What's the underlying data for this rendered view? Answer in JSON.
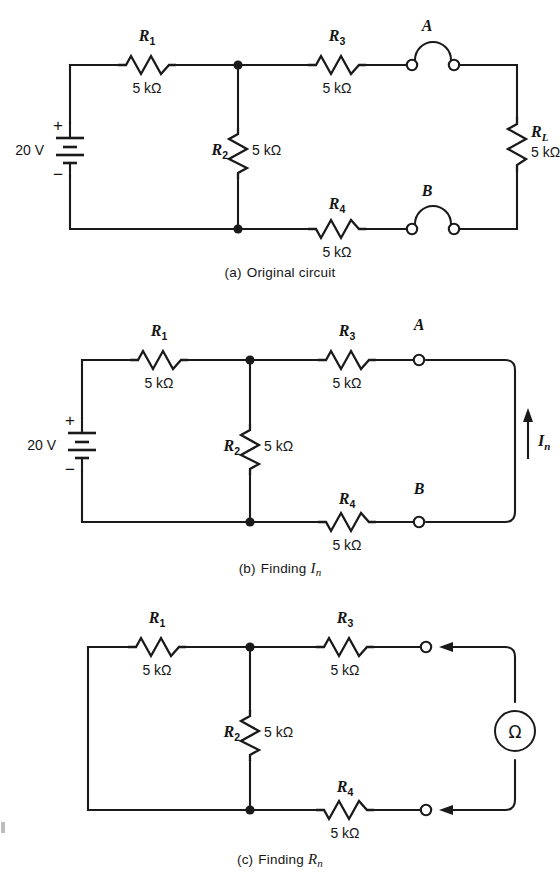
{
  "figure": {
    "background_color": "#ffffff",
    "line_color": "#1a1a1a"
  },
  "panels": [
    {
      "id": "a",
      "caption_label": "(a)",
      "caption_text": "Original circuit",
      "source": {
        "label": "20 V",
        "plus": "+",
        "minus": "−",
        "type": "battery"
      },
      "resistors": [
        {
          "name": "R",
          "sub": "1",
          "value": "5 kΩ",
          "orientation": "horizontal",
          "position": "top-left"
        },
        {
          "name": "R",
          "sub": "2",
          "value": "5 kΩ",
          "orientation": "vertical",
          "position": "middle"
        },
        {
          "name": "R",
          "sub": "3",
          "value": "5 kΩ",
          "orientation": "horizontal",
          "position": "top-right"
        },
        {
          "name": "R",
          "sub": "4",
          "value": "5 kΩ",
          "orientation": "horizontal",
          "position": "bottom-right"
        },
        {
          "name": "R",
          "sub": "L",
          "value": "5 kΩ",
          "orientation": "vertical",
          "position": "far-right"
        }
      ],
      "terminals": [
        {
          "label": "A",
          "position": "top",
          "state": "connected-by-jumper"
        },
        {
          "label": "B",
          "position": "bottom",
          "state": "connected-by-jumper"
        }
      ]
    },
    {
      "id": "b",
      "caption_label": "(b)",
      "caption_text": "Finding ",
      "caption_symbol": "I",
      "caption_symbol_sub": "n",
      "source": {
        "label": "20 V",
        "plus": "+",
        "minus": "−",
        "type": "battery"
      },
      "resistors": [
        {
          "name": "R",
          "sub": "1",
          "value": "5 kΩ",
          "orientation": "horizontal",
          "position": "top-left"
        },
        {
          "name": "R",
          "sub": "2",
          "value": "5 kΩ",
          "orientation": "vertical",
          "position": "middle"
        },
        {
          "name": "R",
          "sub": "3",
          "value": "5 kΩ",
          "orientation": "horizontal",
          "position": "top-right"
        },
        {
          "name": "R",
          "sub": "4",
          "value": "5 kΩ",
          "orientation": "horizontal",
          "position": "bottom-right"
        }
      ],
      "terminals": [
        {
          "label": "A",
          "position": "top",
          "state": "shorted"
        },
        {
          "label": "B",
          "position": "bottom",
          "state": "shorted"
        }
      ],
      "current_arrow": {
        "symbol": "I",
        "sub": "n",
        "direction": "up"
      }
    },
    {
      "id": "c",
      "caption_label": "(c)",
      "caption_text": "Finding ",
      "caption_symbol": "R",
      "caption_symbol_sub": "n",
      "resistors": [
        {
          "name": "R",
          "sub": "1",
          "value": "5 kΩ",
          "orientation": "horizontal",
          "position": "top-left"
        },
        {
          "name": "R",
          "sub": "2",
          "value": "5 kΩ",
          "orientation": "vertical",
          "position": "middle"
        },
        {
          "name": "R",
          "sub": "3",
          "value": "5 kΩ",
          "orientation": "horizontal",
          "position": "top-right"
        },
        {
          "name": "R",
          "sub": "4",
          "value": "5 kΩ",
          "orientation": "horizontal",
          "position": "bottom-right"
        }
      ],
      "terminals": [
        {
          "label": "",
          "position": "top",
          "state": "open"
        },
        {
          "label": "",
          "position": "bottom",
          "state": "open"
        }
      ],
      "meter": {
        "glyph": "Ω",
        "name": "ohmmeter"
      },
      "arrows": [
        {
          "direction": "left",
          "position": "top"
        },
        {
          "direction": "left",
          "position": "bottom"
        }
      ]
    }
  ],
  "labels": {
    "r1": "R",
    "r1_sub": "1",
    "r2": "R",
    "r2_sub": "2",
    "r3": "R",
    "r3_sub": "3",
    "r4": "R",
    "r4_sub": "4",
    "rl": "R",
    "rl_sub": "L",
    "value_5k": "5 kΩ",
    "volts_20": "20 V",
    "plus": "+",
    "minus": "−",
    "terminal_a": "A",
    "terminal_b": "B",
    "in_symbol": "I",
    "in_sub": "n",
    "ohm_glyph": "Ω",
    "cap_a_label": "(a)",
    "cap_a_text": "Original circuit",
    "cap_b_label": "(b)",
    "cap_b_text": "Finding ",
    "cap_b_sym": "I",
    "cap_b_sym_sub": "n",
    "cap_c_label": "(c)",
    "cap_c_text": "Finding ",
    "cap_c_sym": "R",
    "cap_c_sym_sub": "n"
  }
}
